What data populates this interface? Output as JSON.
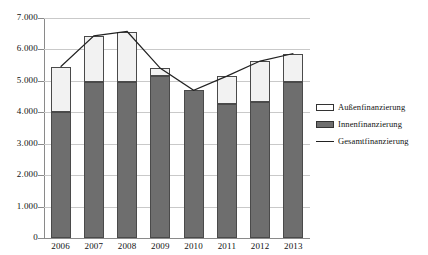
{
  "chart_data": {
    "type": "bar",
    "title": "",
    "subtitle": "",
    "xlabel": "",
    "ylabel": "",
    "categories": [
      "2006",
      "2007",
      "2008",
      "2009",
      "2010",
      "2011",
      "2012",
      "2013"
    ],
    "ylim": [
      0,
      7000
    ],
    "ytick_step": 1000,
    "ytick_labels": [
      "0",
      "1.000",
      "2.000",
      "3.000",
      "4.000",
      "5.000",
      "6.000",
      "7.000"
    ],
    "ytick_values": [
      0,
      1000,
      2000,
      3000,
      4000,
      5000,
      6000,
      7000
    ],
    "grid": true,
    "stacked": true,
    "legend_position": "right",
    "series": [
      {
        "name": "Innenfinanzierung",
        "type": "bar",
        "stack": "total",
        "color": "#6e6e6e",
        "values": [
          4000,
          4950,
          4970,
          5150,
          4700,
          4270,
          4330,
          4960
        ]
      },
      {
        "name": "Außenfinanzierung",
        "type": "bar",
        "stack": "total",
        "color": "#f2f2f2",
        "values": [
          1450,
          1480,
          1600,
          250,
          0,
          880,
          1300,
          910
        ]
      },
      {
        "name": "Gesamtfinanzierung",
        "type": "line",
        "color": "#222222",
        "values": [
          5450,
          6430,
          6570,
          5400,
          4700,
          5150,
          5630,
          5870
        ]
      }
    ]
  },
  "legend": {
    "items": [
      {
        "label": "Außenfinanzierung",
        "key": "swatch-outline-icon"
      },
      {
        "label": "Innenfinanzierung",
        "key": "swatch-filled-icon"
      },
      {
        "label": "Gesamtfinanzierung",
        "key": "line-marker-icon"
      }
    ]
  }
}
